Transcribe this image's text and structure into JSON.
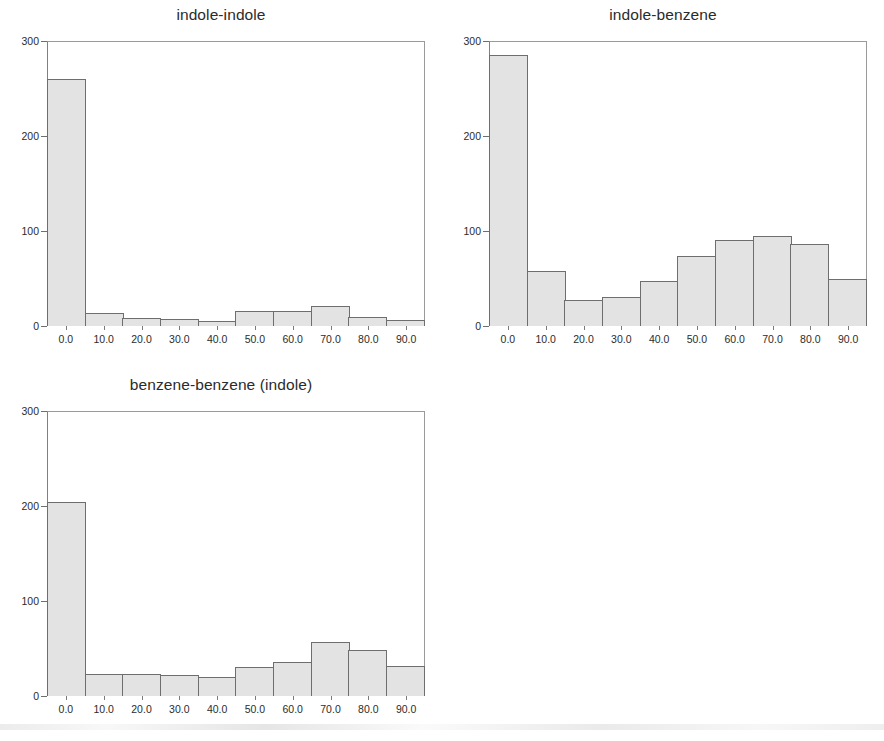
{
  "figure": {
    "background_color": "#ffffff",
    "bar_fill_color": "#e3e3e3",
    "bar_edge_color": "#6e6e6e",
    "axis_color": "#808080",
    "text_color": "#2b2b2b"
  },
  "chart_data": [
    {
      "type": "bar",
      "title": "indole-indole",
      "xlabel": "",
      "ylabel": "",
      "categories": [
        "0.0",
        "10.0",
        "20.0",
        "30.0",
        "40.0",
        "50.0",
        "60.0",
        "70.0",
        "80.0",
        "90.0"
      ],
      "values": [
        260,
        14,
        8,
        7,
        5,
        16,
        16,
        21,
        10,
        6
      ],
      "ylim": [
        0,
        300
      ],
      "yticks": [
        0,
        100,
        200,
        300
      ],
      "ytick_labels": [
        "0",
        "100",
        "200",
        "300"
      ],
      "xtick_labels": [
        "0.0",
        "10.0",
        "20.0",
        "30.0",
        "40.0",
        "50.0",
        "60.0",
        "70.0",
        "80.0",
        "90.0"
      ],
      "grid": false,
      "legend": false
    },
    {
      "type": "bar",
      "title": "indole-benzene",
      "xlabel": "",
      "ylabel": "",
      "categories": [
        "0.0",
        "10.0",
        "20.0",
        "30.0",
        "40.0",
        "50.0",
        "60.0",
        "70.0",
        "80.0",
        "90.0"
      ],
      "values": [
        285,
        58,
        27,
        31,
        47,
        74,
        91,
        95,
        86,
        49
      ],
      "ylim": [
        0,
        300
      ],
      "yticks": [
        0,
        100,
        200,
        300
      ],
      "ytick_labels": [
        "0",
        "100",
        "200",
        "300"
      ],
      "xtick_labels": [
        "0.0",
        "10.0",
        "20.0",
        "30.0",
        "40.0",
        "50.0",
        "60.0",
        "70.0",
        "80.0",
        "90.0"
      ],
      "grid": false,
      "legend": false
    },
    {
      "type": "bar",
      "title": "benzene-benzene (indole)",
      "xlabel": "",
      "ylabel": "",
      "categories": [
        "0.0",
        "10.0",
        "20.0",
        "30.0",
        "40.0",
        "50.0",
        "60.0",
        "70.0",
        "80.0",
        "90.0"
      ],
      "values": [
        204,
        23,
        23,
        22,
        20,
        31,
        36,
        57,
        48,
        32
      ],
      "ylim": [
        0,
        300
      ],
      "yticks": [
        0,
        100,
        200,
        300
      ],
      "ytick_labels": [
        "0",
        "100",
        "200",
        "300"
      ],
      "xtick_labels": [
        "0.0",
        "10.0",
        "20.0",
        "30.0",
        "40.0",
        "50.0",
        "60.0",
        "70.0",
        "80.0",
        "90.0"
      ],
      "grid": false,
      "legend": false
    }
  ]
}
